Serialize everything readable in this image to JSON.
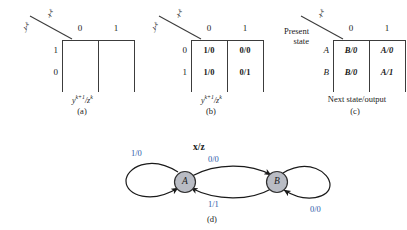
{
  "figure": {
    "panels": [
      {
        "id": "a",
        "caption": "(a)",
        "corner_top_label": "x",
        "corner_top_sup": "k",
        "corner_bottom_label": "y",
        "corner_bottom_sup": "k",
        "col_headers": [
          "0",
          "1"
        ],
        "row_headers": [
          "1",
          "0"
        ],
        "cells": [
          [
            "",
            ""
          ],
          [
            "",
            ""
          ]
        ],
        "footer": "y",
        "footer_sup": "k+1",
        "footer_den": "z",
        "footer_den_sup": "k"
      },
      {
        "id": "b",
        "caption": "(b)",
        "corner_top_label": "x",
        "corner_top_sup": "k",
        "corner_bottom_label": "y",
        "corner_bottom_sup": "k",
        "col_headers": [
          "0",
          "1"
        ],
        "row_headers": [
          "0",
          "1"
        ],
        "cells": [
          [
            "1/0",
            "0/0"
          ],
          [
            "1/0",
            "0/1"
          ]
        ],
        "footer": "y",
        "footer_sup": "k+1",
        "footer_den": "z",
        "footer_den_sup": "k"
      },
      {
        "id": "c",
        "caption": "(c)",
        "corner_top_label": "x",
        "corner_top_sup": "k",
        "present_state_line1": "Present",
        "present_state_line2": "state",
        "col_headers": [
          "0",
          "1"
        ],
        "row_headers": [
          "A",
          "B"
        ],
        "cells": [
          [
            "B/0",
            "A/0"
          ],
          [
            "B/0",
            "A/1"
          ]
        ],
        "footer_text": "Next state/output"
      }
    ],
    "state_diagram": {
      "id": "d",
      "caption": "(d)",
      "header": "x/z",
      "states": [
        {
          "name": "A"
        },
        {
          "name": "B"
        }
      ],
      "transitions": [
        {
          "from": "A",
          "to": "A",
          "label": "1/0",
          "type": "self-loop-left"
        },
        {
          "from": "A",
          "to": "B",
          "label": "0/0",
          "type": "arc-top"
        },
        {
          "from": "B",
          "to": "A",
          "label": "1/1",
          "type": "arc-bottom"
        },
        {
          "from": "B",
          "to": "B",
          "label": "0/0",
          "type": "self-loop-right"
        }
      ],
      "colors": {
        "label_blue": "#2c58a8",
        "state_fill": "#b9bcc4",
        "state_stroke": "#2f2f2f",
        "arrow": "#1a1a1a"
      }
    }
  }
}
